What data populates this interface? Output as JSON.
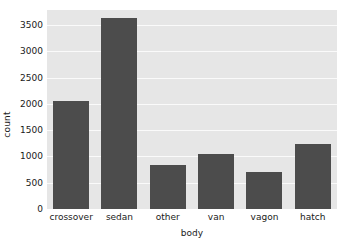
{
  "chart_data": {
    "type": "bar",
    "title": "",
    "xlabel": "body",
    "ylabel": "count",
    "categories": [
      "crossover",
      "sedan",
      "other",
      "van",
      "vagon",
      "hatch"
    ],
    "values": [
      2060,
      3630,
      840,
      1050,
      710,
      1230
    ],
    "ylim": [
      0,
      3790
    ],
    "yticks": [
      0,
      500,
      1000,
      1500,
      2000,
      2500,
      3000,
      3500
    ],
    "ytick_labels": [
      "0",
      "500",
      "1000",
      "1500",
      "2000",
      "2500",
      "3000",
      "3500"
    ],
    "grid": true,
    "legend": null,
    "colors": {
      "bar": "#4c4c4c",
      "plot_background": "#e6e6e6",
      "gridline": "#fafafa",
      "figure_background": "#ffffff",
      "text": "#1a1a1a"
    }
  }
}
